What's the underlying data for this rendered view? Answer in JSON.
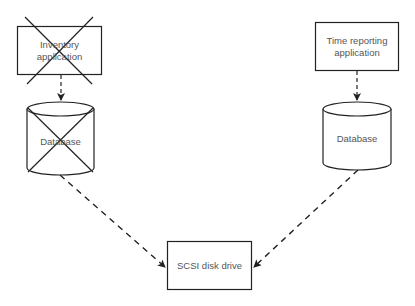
{
  "diagram": {
    "nodes": [
      {
        "id": "inventory_app",
        "label": "Inventory application",
        "label_lines": [
          "Inventory",
          "application"
        ],
        "shape": "rectangle",
        "crossed_out": true
      },
      {
        "id": "inventory_db",
        "label": "Database",
        "shape": "cylinder",
        "crossed_out": true
      },
      {
        "id": "time_app",
        "label": "Time reporting application",
        "label_lines": [
          "Time reporting",
          "application"
        ],
        "shape": "rectangle",
        "crossed_out": false
      },
      {
        "id": "time_db",
        "label": "Database",
        "shape": "cylinder",
        "crossed_out": false
      },
      {
        "id": "scsi",
        "label": "SCSI disk drive",
        "shape": "rectangle",
        "crossed_out": false
      }
    ],
    "edges": [
      {
        "from": "inventory_app",
        "to": "inventory_db",
        "style": "dashed-arrow"
      },
      {
        "from": "time_app",
        "to": "time_db",
        "style": "dashed-arrow"
      },
      {
        "from": "inventory_db",
        "to": "scsi",
        "style": "dashed-arrow"
      },
      {
        "from": "time_db",
        "to": "scsi",
        "style": "dashed-arrow"
      }
    ],
    "colors": {
      "stroke": "#222222",
      "text": "#555555",
      "background": "#ffffff"
    }
  }
}
